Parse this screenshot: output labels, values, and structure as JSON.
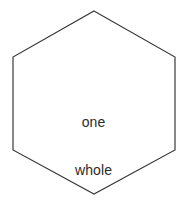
{
  "canvas": {
    "width": 187,
    "height": 204,
    "background_color": "#ffffff"
  },
  "shape": {
    "kind": "hexagon-icon",
    "name": "regular-hexagon",
    "stroke_color": "#3a3a3a",
    "fill_color": "#ffffff",
    "stroke_width": 1.2,
    "vertices": [
      [
        94,
        11
      ],
      [
        175,
        57
      ],
      [
        175,
        150
      ],
      [
        94,
        194
      ],
      [
        13,
        150
      ],
      [
        13,
        57
      ]
    ]
  },
  "label": {
    "line1": "one",
    "line2": "whole",
    "full_text": "one whole",
    "color": "#2b2b2b",
    "font_size": 14
  }
}
